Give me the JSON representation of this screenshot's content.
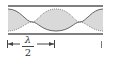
{
  "diagram": {
    "colors": {
      "tube_wall": "#555555",
      "wave_fill": "#d9d9d9",
      "wave_solid": "#666666",
      "wave_dotted": "#888888",
      "annotation": "#444444"
    },
    "annotation": {
      "numerator": "λ",
      "denominator": "2",
      "meaning": "half wavelength"
    }
  }
}
